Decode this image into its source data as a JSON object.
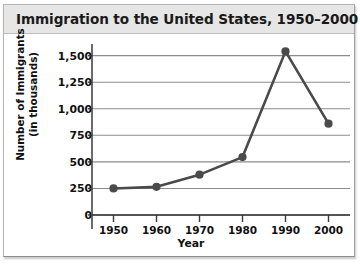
{
  "chart_data": {
    "type": "line",
    "title": "Immigration to the United States, 1950–2000",
    "xlabel": "Year",
    "ylabel_line1": "Number of Immigrants",
    "ylabel_line2": "(in thousands)",
    "x": [
      1950,
      1960,
      1970,
      1980,
      1990,
      2000
    ],
    "xtick_labels": [
      "1950",
      "1960",
      "1970",
      "1980",
      "1990",
      "2000"
    ],
    "values": [
      250,
      265,
      380,
      545,
      1540,
      860
    ],
    "ytick_values": [
      0,
      250,
      500,
      750,
      1000,
      1250,
      1500
    ],
    "ytick_labels": [
      "0",
      "250",
      "500",
      "750",
      "1,000",
      "1,250",
      "1,500"
    ],
    "ylim": [
      0,
      1600
    ],
    "xlim": [
      1945,
      2005
    ],
    "grid": "horizontal",
    "legend": "none",
    "series_name": "Immigrants",
    "marker": "circle",
    "line_color": "#4a4a4a",
    "marker_color": "#4a4a4a",
    "grid_color": "#8c8c8c",
    "axis_color": "#3a3a3a",
    "title_background": "#e6e6e6",
    "plot_background": "#ffffff"
  }
}
